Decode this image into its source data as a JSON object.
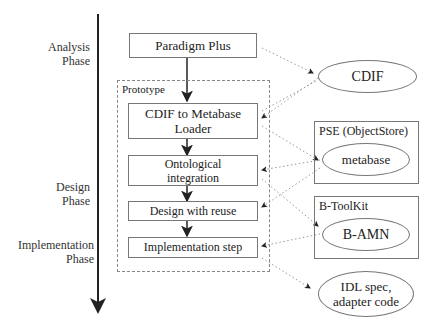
{
  "phases": {
    "analysis": [
      "Analysis",
      "Phase"
    ],
    "design": [
      "Design",
      "Phase"
    ],
    "implementation": [
      "Implementation",
      "Phase"
    ]
  },
  "prototype_group": {
    "title": "Prototype"
  },
  "steps": {
    "paradigm_plus": "Paradigm Plus",
    "cdif_loader": [
      "CDIF to Metabase",
      "Loader"
    ],
    "ontological": [
      "Ontological",
      "integration"
    ],
    "design_reuse": "Design with reuse",
    "implementation": "Implementation step"
  },
  "tools": {
    "pse": {
      "title": "PSE (ObjectStore)",
      "item": "metabase"
    },
    "btoolkit": {
      "title": "B-ToolKit",
      "item": "B-AMN"
    }
  },
  "artifacts": {
    "cdif": "CDIF",
    "idl": [
      "IDL spec,",
      "adapter code"
    ]
  }
}
